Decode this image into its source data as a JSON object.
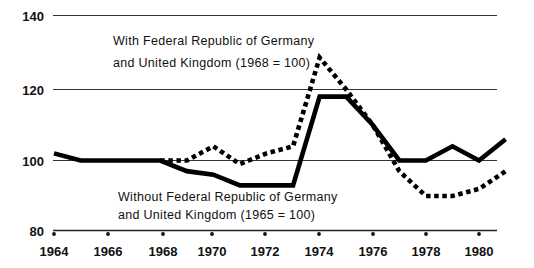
{
  "chart_data": {
    "type": "line",
    "title": "",
    "subtitle": "",
    "xlabel": "",
    "ylabel": "",
    "xlim": [
      1964,
      1981
    ],
    "ylim": [
      80,
      140
    ],
    "yticks": [
      80,
      100,
      120,
      140
    ],
    "ytick_labels": [
      "80",
      "100",
      "120",
      "140"
    ],
    "xticks": [
      1964,
      1966,
      1968,
      1970,
      1972,
      1974,
      1976,
      1978,
      1980
    ],
    "xtick_labels": [
      "1964",
      "1966",
      "1968",
      "1970",
      "1972",
      "1974",
      "1976",
      "1978",
      "1980"
    ],
    "grid": true,
    "grid_axis": "y",
    "legend_position": "inline-annotations",
    "series": [
      {
        "name": "With Federal Republic of Germany and United Kingdom (1968 = 100)",
        "style": "dotted",
        "color": "#000000",
        "x": [
          1968,
          1969,
          1970,
          1971,
          1972,
          1973,
          1974,
          1975,
          1976,
          1977,
          1978,
          1979,
          1980,
          1981
        ],
        "values": [
          100,
          100,
          104,
          99,
          102,
          104,
          129,
          120,
          110,
          97,
          90,
          90,
          92,
          97
        ]
      },
      {
        "name": "Without Federal Republic of Germany and United Kingdom (1965 = 100)",
        "style": "solid",
        "color": "#000000",
        "x": [
          1964,
          1965,
          1966,
          1967,
          1968,
          1969,
          1970,
          1971,
          1972,
          1973,
          1974,
          1975,
          1976,
          1977,
          1978,
          1979,
          1980,
          1981
        ],
        "values": [
          102,
          100,
          100,
          100,
          100,
          97,
          96,
          93,
          93,
          93,
          118,
          118,
          110,
          100,
          100,
          104,
          100,
          106
        ]
      }
    ],
    "annotations": [
      {
        "id": "annotation-with",
        "line1": "With Federal Republic of Germany",
        "line2": "and United Kingdom (1968 = 100)"
      },
      {
        "id": "annotation-without",
        "line1": "Without Federal Republic of Germany",
        "line2": "and United Kingdom (1965 = 100)"
      }
    ],
    "colors": {
      "background": "#ffffff",
      "ink": "#000000",
      "grid": "#333333"
    }
  }
}
